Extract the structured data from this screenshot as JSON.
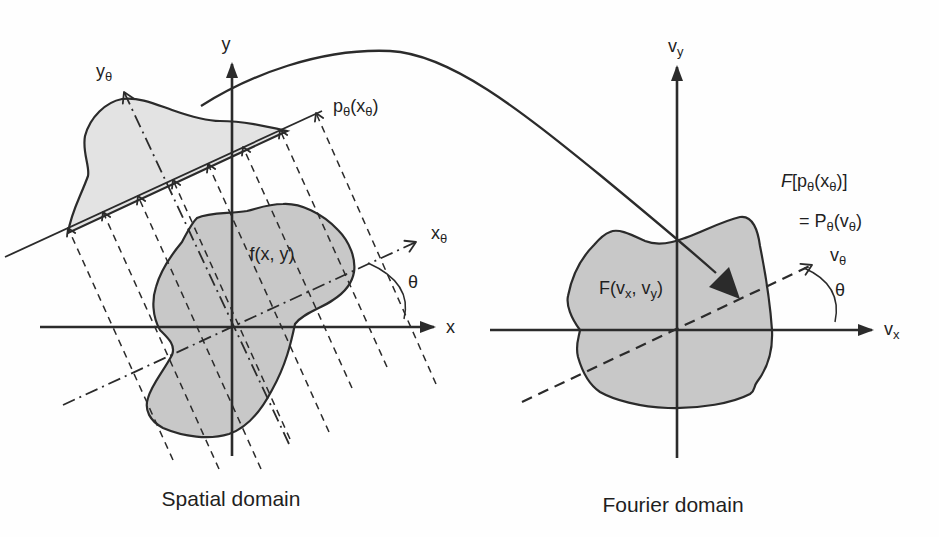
{
  "figure": {
    "caption_left": "Spatial domain",
    "caption_right": "Fourier domain"
  },
  "colors": {
    "line": "#2b2b2b",
    "blob": "#c8c8c8",
    "profile": "#e3e3e3",
    "bg": "#fefefe",
    "text": "#1f1f1f"
  },
  "spatial": {
    "axis_x": "x",
    "axis_y": "y",
    "x_theta": {
      "main": "x",
      "sub": "θ"
    },
    "y_theta": {
      "main": "y",
      "sub": "θ"
    },
    "theta": "θ",
    "function_label": "f(x, y)",
    "projection": {
      "parts": [
        "p",
        "θ",
        "(x",
        "θ",
        ")"
      ]
    }
  },
  "fourier": {
    "axis_vx": {
      "main": "v",
      "sub": "x"
    },
    "axis_vy": {
      "main": "v",
      "sub": "y"
    },
    "v_theta": {
      "main": "v",
      "sub": "θ"
    },
    "theta": "θ",
    "function_label": {
      "parts": [
        "F(v",
        "x",
        ", v",
        "y",
        ")"
      ]
    },
    "transform_eq_line1": {
      "parts": [
        "F",
        "[p",
        "θ",
        "(x",
        "θ",
        ")]"
      ]
    },
    "transform_eq_line2": {
      "parts": [
        "= P",
        "θ",
        "(v",
        "θ",
        ")"
      ]
    }
  }
}
